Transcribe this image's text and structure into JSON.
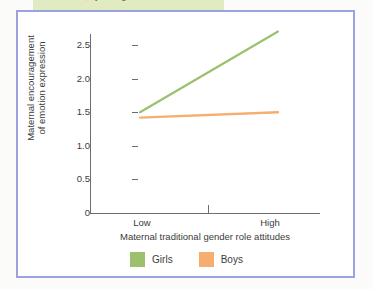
{
  "figure": {
    "caption_fragment": "role attitudes, by child gender",
    "frame_color": "#9aa3de",
    "highlight_color": "#dfe8bc"
  },
  "chart_data": {
    "type": "line",
    "title": "",
    "xlabel": "Maternal traditional gender role attitudes",
    "ylabel": "Maternal encouragement of emotion expression",
    "ylabel_line1": "Maternal encouragement",
    "ylabel_line2": "of emotion expression",
    "categories": [
      "Low",
      "High"
    ],
    "x": [
      0,
      1
    ],
    "ylim": [
      0,
      2.75
    ],
    "yticks": [
      0,
      0.5,
      1.0,
      1.5,
      2.0,
      2.5
    ],
    "ytick_labels": [
      "0",
      "0.5",
      "1.0",
      "1.5",
      "2.0",
      "2.5"
    ],
    "grid": false,
    "legend_position": "bottom",
    "series": [
      {
        "name": "Girls",
        "color": "#9cc16e",
        "values": [
          1.5,
          2.7
        ]
      },
      {
        "name": "Boys",
        "color": "#f2ab६e",
        "values": [
          1.42,
          1.5
        ]
      }
    ]
  },
  "legend": {
    "items": [
      {
        "label": "Girls",
        "color": "#9cc16e"
      },
      {
        "label": "Boys",
        "color": "#f5ae70"
      }
    ]
  },
  "axes": {
    "y_ticks": [
      {
        "label": "2.5",
        "value": 2.5
      },
      {
        "label": "2.0",
        "value": 2.0
      },
      {
        "label": "1.5",
        "value": 1.5
      },
      {
        "label": "1.0",
        "value": 1.0
      },
      {
        "label": "0.5",
        "value": 0.5
      },
      {
        "label": "0",
        "value": 0
      }
    ],
    "x_ticks": [
      {
        "label": "Low"
      },
      {
        "label": "High"
      }
    ]
  }
}
